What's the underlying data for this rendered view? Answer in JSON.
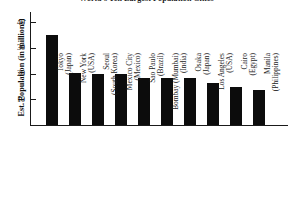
{
  "chart_data": {
    "type": "bar",
    "title": "World's Ten Largest Population Cities",
    "xlabel": "",
    "ylabel": "Est. Population (in millions)",
    "ylim": [
      0,
      44
    ],
    "yticks": [
      10,
      20,
      30,
      40
    ],
    "ytick_labels": [
      "10",
      "20",
      "30",
      "40"
    ],
    "grid": false,
    "legend": "none",
    "bar_color": "#0c0c0c",
    "categories": [
      "Tokyo (Japan)",
      "New York (USA)",
      "Seoul (South Korea)",
      "Mexico City (Mexico)",
      "Sao Paulo (Brazil)",
      "Bombay (Mumbai) (India)",
      "Osaka (Japan)",
      "Los Angeles (USA)",
      "Cairo (Egypt)",
      "Manila (Philippines)"
    ],
    "values": [
      35.0,
      20.3,
      20.0,
      20.0,
      18.3,
      18.2,
      18.2,
      16.4,
      14.8,
      13.5
    ],
    "points": [
      {
        "city": "Tokyo",
        "country": "Japan",
        "line1": "Tokyo",
        "line2": "(Japan)",
        "value": 35.0
      },
      {
        "city": "New York",
        "country": "USA",
        "line1": "New York",
        "line2": "(USA)",
        "value": 20.3
      },
      {
        "city": "Seoul",
        "country": "South Korea",
        "line1": "Seoul",
        "line2": "(South Korea)",
        "value": 20.0
      },
      {
        "city": "Mexico City",
        "country": "Mexico",
        "line1": "Mexico City",
        "line2": "(Mexico)",
        "value": 20.0
      },
      {
        "city": "Sao Paulo",
        "country": "Brazil",
        "line1": "Sao Paulo",
        "line2": "(Brazil)",
        "value": 18.3
      },
      {
        "city": "Bombay",
        "country": "India",
        "line1": "Bombay (Mumbai)",
        "line2": "(India)",
        "value": 18.2
      },
      {
        "city": "Osaka",
        "country": "Japan",
        "line1": "Osaka",
        "line2": "(Japan)",
        "value": 18.2
      },
      {
        "city": "Los Angeles",
        "country": "USA",
        "line1": "Los Angeles",
        "line2": "(USA)",
        "value": 16.4
      },
      {
        "city": "Cairo",
        "country": "Egypt",
        "line1": "Cairo",
        "line2": "(Egypt)",
        "value": 14.8
      },
      {
        "city": "Manila",
        "country": "Philippines",
        "line1": "Manila",
        "line2": "(Philippines)",
        "value": 13.5
      }
    ]
  }
}
